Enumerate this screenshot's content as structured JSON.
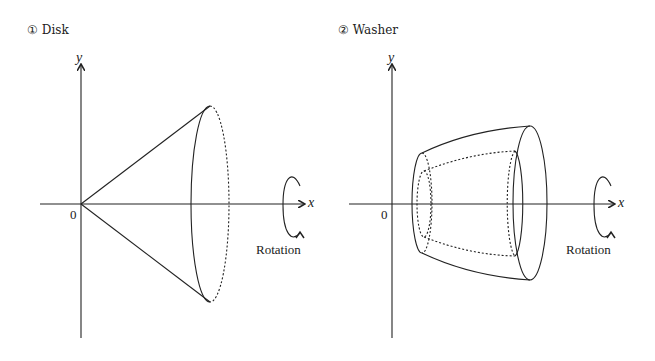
{
  "panels": [
    {
      "title": "① Disk",
      "x_axis_label": "x",
      "y_axis_label": "y",
      "origin_label": "0",
      "rotation_label": "Rotation",
      "shape": "cone"
    },
    {
      "title": "② Washer",
      "x_axis_label": "x",
      "y_axis_label": "y",
      "origin_label": "0",
      "rotation_label": "Rotation",
      "shape": "hollow-frustum"
    }
  ],
  "colors": {
    "stroke": "#222222",
    "background": "#ffffff"
  }
}
